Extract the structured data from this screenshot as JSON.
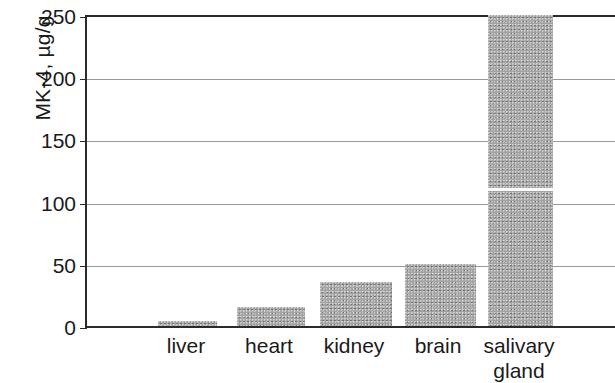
{
  "chart_data": {
    "type": "bar",
    "title": "",
    "xlabel": "",
    "ylabel": "MK-4, µg/g",
    "categories": [
      "liver",
      "heart",
      "kidney",
      "brain",
      "salivary\ngland"
    ],
    "values": [
      4,
      15,
      35,
      50,
      250
    ],
    "value_notes": {
      "salivary gland": "bar exceeds axis maximum; drawn clipped at 250 with a white break line near 108"
    },
    "ylim": [
      0,
      250
    ],
    "ytick_labels": [
      "0",
      "50",
      "100",
      "150",
      "200",
      "250"
    ],
    "ytick_values": [
      0,
      50,
      100,
      150,
      200,
      250
    ],
    "grid": true,
    "grid_values": [
      50,
      100,
      150,
      200
    ],
    "legend": null,
    "legend_position": "none",
    "bar_color": "#a3a3a3",
    "axis_color": "#2b2b2b",
    "grid_color": "#9a9a9a",
    "background_color": "#ffffff"
  },
  "axes": {
    "y_title": "MK-4, µg/g",
    "ticks": [
      {
        "label": "250",
        "value": 250
      },
      {
        "label": "200",
        "value": 200
      },
      {
        "label": "150",
        "value": 150
      },
      {
        "label": "100",
        "value": 100
      },
      {
        "label": "50",
        "value": 50
      },
      {
        "label": "0",
        "value": 0
      }
    ]
  },
  "bars": [
    {
      "label": "liver",
      "value": 4
    },
    {
      "label": "heart",
      "value": 15
    },
    {
      "label": "kidney",
      "value": 35
    },
    {
      "label": "brain",
      "value": 50
    },
    {
      "label": "salivary\ngland",
      "value": 250
    }
  ]
}
